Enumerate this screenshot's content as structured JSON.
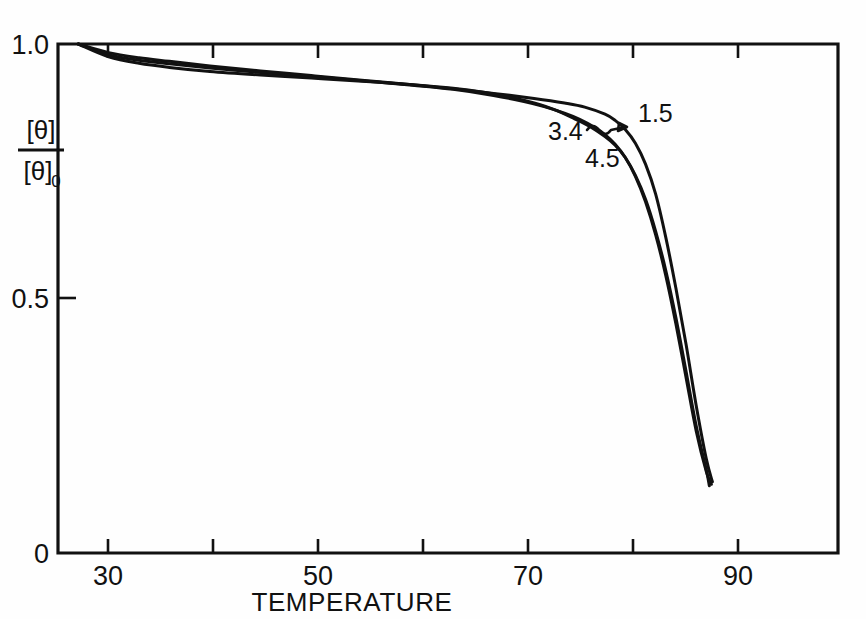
{
  "chart_data": {
    "type": "line",
    "title": "",
    "xlabel": "TEMPERATURE",
    "ylabel_numerator": "[θ]",
    "ylabel_denominator": "[θ]",
    "ylabel_denominator_subscript": "0",
    "xlim": [
      25,
      102
    ],
    "ylim": [
      0,
      1.0
    ],
    "grid": false,
    "legend_position": "inline-labels",
    "x_ticks": [
      30,
      40,
      50,
      60,
      70,
      80,
      90
    ],
    "x_tick_labels": [
      "30",
      "",
      "50",
      "",
      "70",
      "",
      "90"
    ],
    "y_ticks": [
      0,
      0.5,
      1.0
    ],
    "y_tick_labels": [
      "0",
      "0.5",
      "1.0"
    ],
    "series": [
      {
        "name": "1.5",
        "label": "1.5",
        "x": [
          27,
          30,
          33,
          36,
          40,
          45,
          50,
          55,
          60,
          64,
          68,
          72,
          75,
          77,
          79,
          80,
          81,
          82,
          83,
          84,
          85,
          86,
          87,
          88,
          89,
          89.6
        ],
        "values": [
          1.0,
          0.983,
          0.973,
          0.966,
          0.957,
          0.947,
          0.938,
          0.929,
          0.92,
          0.912,
          0.903,
          0.893,
          0.884,
          0.876,
          0.862,
          0.85,
          0.832,
          0.805,
          0.764,
          0.705,
          0.62,
          0.52,
          0.41,
          0.29,
          0.185,
          0.14
        ]
      },
      {
        "name": "3.4",
        "label": "3.4",
        "x": [
          27,
          30,
          33,
          36,
          40,
          45,
          50,
          55,
          60,
          64,
          68,
          71,
          73,
          75,
          76.5,
          78,
          79,
          80,
          81,
          82,
          83,
          84,
          85,
          86,
          87,
          88,
          89,
          89.5
        ],
        "values": [
          1.0,
          0.979,
          0.968,
          0.961,
          0.953,
          0.944,
          0.936,
          0.928,
          0.919,
          0.911,
          0.899,
          0.887,
          0.877,
          0.864,
          0.852,
          0.836,
          0.822,
          0.803,
          0.777,
          0.74,
          0.69,
          0.625,
          0.545,
          0.45,
          0.345,
          0.24,
          0.16,
          0.135
        ]
      },
      {
        "name": "4.5",
        "label": "4.5",
        "x": [
          27,
          30,
          33,
          36,
          40,
          45,
          50,
          55,
          60,
          64,
          67,
          70,
          72,
          74,
          76,
          77.5,
          79,
          80,
          81,
          82,
          83,
          84,
          85,
          86,
          87,
          88,
          89,
          89.3
        ],
        "values": [
          1.0,
          0.975,
          0.962,
          0.954,
          0.946,
          0.939,
          0.933,
          0.927,
          0.92,
          0.913,
          0.905,
          0.894,
          0.884,
          0.871,
          0.853,
          0.838,
          0.818,
          0.801,
          0.777,
          0.742,
          0.695,
          0.632,
          0.555,
          0.462,
          0.357,
          0.25,
          0.163,
          0.132
        ]
      }
    ],
    "annotations": [
      {
        "text": "1.5",
        "x_px": 638,
        "y_px": 122,
        "points_to": "1.5"
      },
      {
        "text": "3.4",
        "x_px": 551,
        "y_px": 136,
        "points_to": "3.4"
      },
      {
        "text": "4.5",
        "x_px": 588,
        "y_px": 162,
        "points_to": "4.5"
      }
    ]
  },
  "axes": {
    "x_title": "TEMPERATURE",
    "y_numerator": "[θ]",
    "y_denominator": "[θ]",
    "y_denominator_sub": "0"
  },
  "tick_labels": {
    "y_top": "1.0",
    "y_mid": "0.5",
    "y_bottom": "0",
    "x1": "30",
    "x2": "50",
    "x3": "70",
    "x4": "90"
  },
  "colors": {
    "ink": "#111111",
    "background": "#ffffff"
  }
}
